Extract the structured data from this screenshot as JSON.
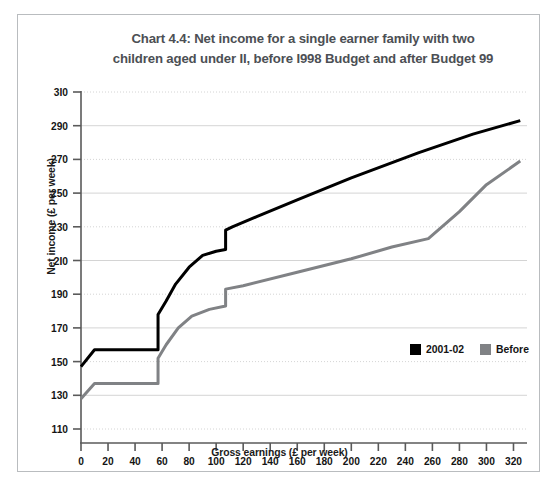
{
  "figure": {
    "title": "Chart 4.4: Net income for a single earner family with two children aged under II, before I998 Budget and after Budget 99",
    "title_line1": "Chart 4.4: Net income for a single earner family with two",
    "title_line2": "children aged under II, before I998 Budget and after Budget 99",
    "title_color": "#4c4f54",
    "border_color": "#b9bcbf",
    "background": "#ffffff"
  },
  "chart_data": {
    "type": "line",
    "title": "Chart 4.4: Net income for a single earner family with two children aged under II, before I998 Budget and after Budget 99",
    "xlabel": "Gross earnings (£ per week)",
    "ylabel": "Net income (£ per week)",
    "xlim": [
      0,
      330
    ],
    "ylim": [
      110,
      310
    ],
    "xticks": [
      0,
      20,
      40,
      60,
      80,
      100,
      120,
      140,
      160,
      180,
      200,
      220,
      240,
      260,
      280,
      300,
      320
    ],
    "yticks": [
      110,
      130,
      150,
      170,
      190,
      210,
      230,
      250,
      270,
      290,
      310
    ],
    "xtick_labels": [
      "0",
      "20",
      "40",
      "60",
      "80",
      "100",
      "120",
      "140",
      "160",
      "180",
      "200",
      "220",
      "240",
      "260",
      "280",
      "300",
      "320"
    ],
    "ytick_labels": [
      "110",
      "130",
      "150",
      "170",
      "190",
      "2I0",
      "230",
      "250",
      "270",
      "290",
      "3I0"
    ],
    "grid": true,
    "grid_color": "#c9c9c9",
    "legend_position": "lower right",
    "series": [
      {
        "name": "2001-02",
        "color": "#000000",
        "linewidth": 3.0,
        "points": [
          [
            0,
            147
          ],
          [
            10,
            157
          ],
          [
            57,
            157
          ],
          [
            57,
            178
          ],
          [
            63,
            186
          ],
          [
            70,
            196
          ],
          [
            80,
            206
          ],
          [
            90,
            213
          ],
          [
            100,
            215.5
          ],
          [
            107,
            216.5
          ],
          [
            107,
            228
          ],
          [
            112,
            230
          ],
          [
            130,
            236
          ],
          [
            160,
            246
          ],
          [
            200,
            259
          ],
          [
            250,
            274
          ],
          [
            290,
            285
          ],
          [
            325,
            293
          ]
        ]
      },
      {
        "name": "Before",
        "color": "#808285",
        "linewidth": 3.0,
        "points": [
          [
            0,
            128
          ],
          [
            10,
            137
          ],
          [
            57,
            137
          ],
          [
            57,
            152
          ],
          [
            63,
            160
          ],
          [
            72,
            170
          ],
          [
            82,
            177
          ],
          [
            95,
            181
          ],
          [
            107,
            183
          ],
          [
            107,
            193
          ],
          [
            120,
            195
          ],
          [
            160,
            203
          ],
          [
            200,
            211
          ],
          [
            230,
            218
          ],
          [
            257,
            223
          ],
          [
            280,
            239
          ],
          [
            300,
            255
          ],
          [
            325,
            269
          ]
        ]
      }
    ]
  },
  "legend": {
    "items": [
      {
        "label": "2001-02",
        "swatch_color": "#000000"
      },
      {
        "label": "Before",
        "swatch_color": "#808285"
      }
    ]
  }
}
